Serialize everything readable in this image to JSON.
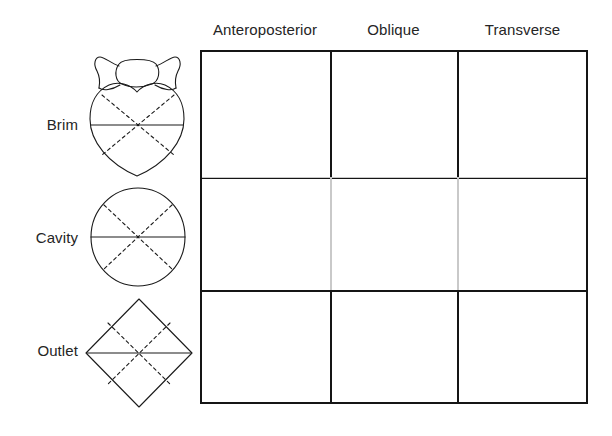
{
  "figure": {
    "background_color": "#ffffff",
    "line_color": "#151515",
    "light_line_color": "#c9c9c9",
    "text_color": "#252525"
  },
  "columns": [
    {
      "id": "anteroposterior",
      "label": "Anteroposterior"
    },
    {
      "id": "oblique",
      "label": "Oblique"
    },
    {
      "id": "transverse",
      "label": "Transverse"
    }
  ],
  "rows": [
    {
      "id": "brim",
      "label": "Brim",
      "diagram": "pelvic-brim-heart-shape"
    },
    {
      "id": "cavity",
      "label": "Cavity",
      "diagram": "pelvic-cavity-circle-shape"
    },
    {
      "id": "outlet",
      "label": "Outlet",
      "diagram": "pelvic-outlet-diamond-shape"
    }
  ],
  "cells": [
    {
      "row": "brim",
      "column": "anteroposterior",
      "value": "",
      "emphasis": "bold"
    },
    {
      "row": "brim",
      "column": "oblique",
      "value": "",
      "emphasis": "bold"
    },
    {
      "row": "brim",
      "column": "transverse",
      "value": "",
      "emphasis": "bold"
    },
    {
      "row": "cavity",
      "column": "anteroposterior",
      "value": "",
      "emphasis": "light"
    },
    {
      "row": "cavity",
      "column": "oblique",
      "value": "",
      "emphasis": "light"
    },
    {
      "row": "cavity",
      "column": "transverse",
      "value": "",
      "emphasis": "light"
    },
    {
      "row": "outlet",
      "column": "anteroposterior",
      "value": "",
      "emphasis": "bold"
    },
    {
      "row": "outlet",
      "column": "oblique",
      "value": "",
      "emphasis": "bold"
    },
    {
      "row": "outlet",
      "column": "transverse",
      "value": "",
      "emphasis": "bold"
    }
  ],
  "diagram_legend": {
    "solid_line_meaning": "transverse diameter",
    "dashed_line_meaning": "oblique diameters"
  }
}
